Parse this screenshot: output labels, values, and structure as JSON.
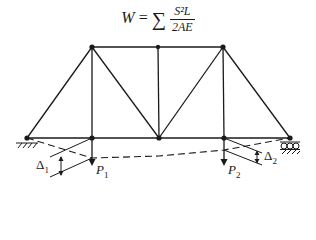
{
  "equation": {
    "lhs": "W",
    "equals": "=",
    "sigma": "∑",
    "numerator": "S²L",
    "denominator": "2AE"
  },
  "labels": {
    "p1": {
      "main": "P",
      "sub": "1"
    },
    "p2": {
      "main": "P",
      "sub": "2"
    },
    "delta1": {
      "main": "Δ",
      "sub": "1"
    },
    "delta2": {
      "main": "Δ",
      "sub": "2"
    }
  },
  "truss": {
    "top_nodes": [
      [
        92,
        47
      ],
      [
        158,
        47
      ],
      [
        223,
        47
      ]
    ],
    "bottom_nodes": [
      [
        27,
        138
      ],
      [
        92,
        138
      ],
      [
        159,
        138
      ],
      [
        224,
        138
      ],
      [
        290,
        138
      ]
    ],
    "deflected_shape": [
      [
        27,
        138
      ],
      [
        92,
        158
      ],
      [
        159,
        156
      ],
      [
        224,
        150
      ],
      [
        290,
        138
      ]
    ],
    "supports": {
      "left": "pin",
      "right": "roller"
    },
    "line_color": "#1a1a1a"
  }
}
